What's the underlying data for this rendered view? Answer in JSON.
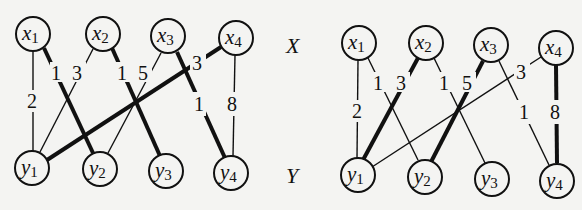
{
  "side_labels": {
    "top": "X",
    "bottom": "Y"
  },
  "graphs": [
    {
      "id": "left",
      "nodes": {
        "x1": {
          "base": "x",
          "sub": "1"
        },
        "x2": {
          "base": "x",
          "sub": "2"
        },
        "x3": {
          "base": "x",
          "sub": "3"
        },
        "x4": {
          "base": "x",
          "sub": "4"
        },
        "y1": {
          "base": "y",
          "sub": "1"
        },
        "y2": {
          "base": "y",
          "sub": "2"
        },
        "y3": {
          "base": "y",
          "sub": "3"
        },
        "y4": {
          "base": "y",
          "sub": "4"
        }
      },
      "edges": [
        {
          "from": "x1",
          "to": "y1",
          "weight": "2",
          "bold": false
        },
        {
          "from": "x1",
          "to": "y2",
          "weight": "1",
          "bold": true
        },
        {
          "from": "x2",
          "to": "y1",
          "weight": "3",
          "bold": false
        },
        {
          "from": "x2",
          "to": "y3",
          "weight": "1",
          "bold": true
        },
        {
          "from": "x3",
          "to": "y2",
          "weight": "5",
          "bold": false
        },
        {
          "from": "x3",
          "to": "y4",
          "weight": "1",
          "bold": true
        },
        {
          "from": "x4",
          "to": "y1",
          "weight": "3",
          "bold": true
        },
        {
          "from": "x4",
          "to": "y4",
          "weight": "8",
          "bold": false
        }
      ]
    },
    {
      "id": "right",
      "nodes": {
        "x1": {
          "base": "x",
          "sub": "1"
        },
        "x2": {
          "base": "x",
          "sub": "2"
        },
        "x3": {
          "base": "x",
          "sub": "3"
        },
        "x4": {
          "base": "x",
          "sub": "4"
        },
        "y1": {
          "base": "y",
          "sub": "1"
        },
        "y2": {
          "base": "y",
          "sub": "2"
        },
        "y3": {
          "base": "y",
          "sub": "3"
        },
        "y4": {
          "base": "y",
          "sub": "4"
        }
      },
      "edges": [
        {
          "from": "x1",
          "to": "y1",
          "weight": "2",
          "bold": false
        },
        {
          "from": "x1",
          "to": "y2",
          "weight": "1",
          "bold": false
        },
        {
          "from": "x2",
          "to": "y1",
          "weight": "3",
          "bold": true
        },
        {
          "from": "x2",
          "to": "y3",
          "weight": "1",
          "bold": false
        },
        {
          "from": "x3",
          "to": "y2",
          "weight": "5",
          "bold": true
        },
        {
          "from": "x3",
          "to": "y4",
          "weight": "1",
          "bold": false
        },
        {
          "from": "x4",
          "to": "y1",
          "weight": "3",
          "bold": false
        },
        {
          "from": "x4",
          "to": "y4",
          "weight": "8",
          "bold": true
        }
      ]
    }
  ]
}
